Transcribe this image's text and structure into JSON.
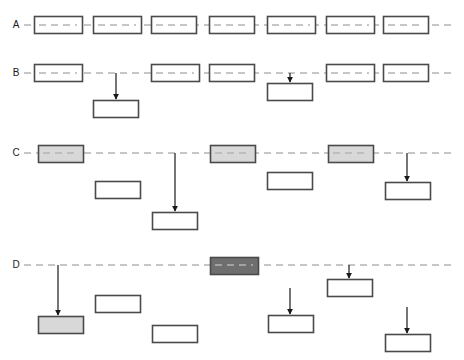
{
  "diagram": {
    "width": 464,
    "height": 360,
    "colors": {
      "background": "#ffffff",
      "box_stroke": "#4a4a4a",
      "box_fill_empty": "#ffffff",
      "box_fill_light": "#d8d8d8",
      "box_fill_dark": "#6e6e6e",
      "timeline_dash": "#b4b4b4",
      "arrow": "#1a1a1a",
      "label_text": "#1a1a1a"
    },
    "box_size": {
      "width": 48,
      "height": 17
    },
    "rows": [
      {
        "id": "row-a",
        "label": "A",
        "label_x": 16,
        "line_y": 25,
        "line_start_x": 24,
        "line_end_x": 452,
        "boxes": [
          {
            "name": "box-a1",
            "x": 34,
            "y": 16,
            "w": 48,
            "h": 17,
            "fill": "empty",
            "on_line": true
          },
          {
            "name": "box-a2",
            "x": 93,
            "y": 16,
            "w": 48,
            "h": 17,
            "fill": "empty",
            "on_line": true
          },
          {
            "name": "box-a3",
            "x": 151,
            "y": 16,
            "w": 45,
            "h": 17,
            "fill": "empty",
            "on_line": true
          },
          {
            "name": "box-a4",
            "x": 209,
            "y": 16,
            "w": 45,
            "h": 17,
            "fill": "empty",
            "on_line": true
          },
          {
            "name": "box-a5",
            "x": 267,
            "y": 16,
            "w": 48,
            "h": 17,
            "fill": "empty",
            "on_line": true
          },
          {
            "name": "box-a6",
            "x": 326,
            "y": 16,
            "w": 48,
            "h": 17,
            "fill": "empty",
            "on_line": true
          },
          {
            "name": "box-a7",
            "x": 383,
            "y": 16,
            "w": 45,
            "h": 17,
            "fill": "empty",
            "on_line": true
          }
        ],
        "arrows": []
      },
      {
        "id": "row-b",
        "label": "B",
        "label_x": 16,
        "line_y": 73,
        "line_start_x": 24,
        "line_end_x": 452,
        "boxes": [
          {
            "name": "box-b1",
            "x": 34,
            "y": 64,
            "w": 48,
            "h": 17,
            "fill": "empty",
            "on_line": true
          },
          {
            "name": "box-b2",
            "x": 93,
            "y": 100,
            "w": 45,
            "h": 17,
            "fill": "empty",
            "on_line": false
          },
          {
            "name": "box-b3",
            "x": 151,
            "y": 64,
            "w": 48,
            "h": 17,
            "fill": "empty",
            "on_line": true
          },
          {
            "name": "box-b4",
            "x": 209,
            "y": 64,
            "w": 45,
            "h": 17,
            "fill": "empty",
            "on_line": true
          },
          {
            "name": "box-b5",
            "x": 267,
            "y": 83,
            "w": 45,
            "h": 17,
            "fill": "empty",
            "on_line": false
          },
          {
            "name": "box-b6",
            "x": 326,
            "y": 64,
            "w": 48,
            "h": 17,
            "fill": "empty",
            "on_line": true
          },
          {
            "name": "box-b7",
            "x": 383,
            "y": 64,
            "w": 45,
            "h": 17,
            "fill": "empty",
            "on_line": true
          }
        ],
        "arrows": [
          {
            "name": "arrow-b1",
            "x": 116,
            "y_start": 73,
            "y_end": 99
          },
          {
            "name": "arrow-b2",
            "x": 290,
            "y_start": 73,
            "y_end": 82
          }
        ]
      },
      {
        "id": "row-c",
        "label": "C",
        "label_x": 16,
        "line_y": 153,
        "line_start_x": 24,
        "line_end_x": 452,
        "boxes": [
          {
            "name": "box-c1",
            "x": 38,
            "y": 145,
            "w": 45,
            "h": 17,
            "fill": "light",
            "on_line": true
          },
          {
            "name": "box-c2",
            "x": 95,
            "y": 181,
            "w": 45,
            "h": 17,
            "fill": "empty",
            "on_line": false
          },
          {
            "name": "box-c3",
            "x": 152,
            "y": 212,
            "w": 45,
            "h": 17,
            "fill": "empty",
            "on_line": false
          },
          {
            "name": "box-c4",
            "x": 210,
            "y": 145,
            "w": 45,
            "h": 17,
            "fill": "light",
            "on_line": true
          },
          {
            "name": "box-c5",
            "x": 267,
            "y": 172,
            "w": 45,
            "h": 17,
            "fill": "empty",
            "on_line": false
          },
          {
            "name": "box-c6",
            "x": 328,
            "y": 145,
            "w": 45,
            "h": 17,
            "fill": "light",
            "on_line": true
          },
          {
            "name": "box-c7",
            "x": 385,
            "y": 182,
            "w": 45,
            "h": 17,
            "fill": "empty",
            "on_line": false
          }
        ],
        "arrows": [
          {
            "name": "arrow-c1",
            "x": 175,
            "y_start": 153,
            "y_end": 211
          },
          {
            "name": "arrow-c2",
            "x": 407,
            "y_start": 153,
            "y_end": 181
          }
        ]
      },
      {
        "id": "row-d",
        "label": "D",
        "label_x": 16,
        "line_y": 265,
        "line_start_x": 24,
        "line_end_x": 452,
        "boxes": [
          {
            "name": "box-d1",
            "x": 38,
            "y": 316,
            "w": 45,
            "h": 17,
            "fill": "light",
            "on_line": false
          },
          {
            "name": "box-d2",
            "x": 95,
            "y": 295,
            "w": 45,
            "h": 17,
            "fill": "empty",
            "on_line": false
          },
          {
            "name": "box-d3",
            "x": 152,
            "y": 325,
            "w": 45,
            "h": 17,
            "fill": "empty",
            "on_line": false
          },
          {
            "name": "box-d4",
            "x": 210,
            "y": 257,
            "w": 48,
            "h": 17,
            "fill": "dark",
            "on_line": true
          },
          {
            "name": "box-d5",
            "x": 268,
            "y": 315,
            "w": 45,
            "h": 17,
            "fill": "empty",
            "on_line": false
          },
          {
            "name": "box-d6",
            "x": 327,
            "y": 279,
            "w": 45,
            "h": 17,
            "fill": "empty",
            "on_line": false
          },
          {
            "name": "box-d7",
            "x": 385,
            "y": 334,
            "w": 45,
            "h": 17,
            "fill": "empty",
            "on_line": false
          }
        ],
        "arrows": [
          {
            "name": "arrow-d1",
            "x": 58,
            "y_start": 265,
            "y_end": 315
          },
          {
            "name": "arrow-d2",
            "x": 290,
            "y_start": 288,
            "y_end": 314
          },
          {
            "name": "arrow-d3",
            "x": 349,
            "y_start": 265,
            "y_end": 278
          },
          {
            "name": "arrow-d4",
            "x": 407,
            "y_start": 307,
            "y_end": 333
          }
        ]
      }
    ]
  }
}
